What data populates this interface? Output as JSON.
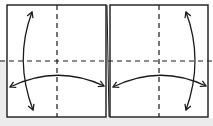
{
  "diagram": {
    "type": "origami-fold-instruction",
    "panels": [
      {
        "id": "left-square",
        "fold_lines": [
          "horizontal-valley-center",
          "vertical-valley-center"
        ],
        "arrows": [
          "vertical-double-arrow-left-side",
          "horizontal-double-arrow-lower"
        ]
      },
      {
        "id": "right-square",
        "fold_lines": [
          "horizontal-valley-center",
          "vertical-valley-center"
        ],
        "arrows": [
          "vertical-double-arrow-right-side",
          "horizontal-double-arrow-lower"
        ]
      }
    ],
    "colors": {
      "line": "#1a1a1a",
      "paper": "#ffffff",
      "shadow": "#e6e6e6"
    }
  }
}
